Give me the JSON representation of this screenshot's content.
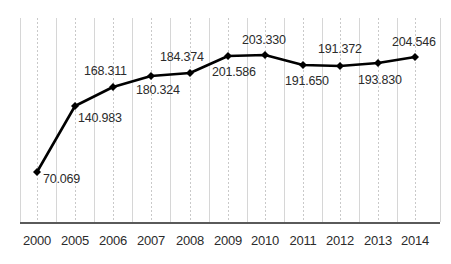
{
  "chart_data": {
    "type": "line",
    "title": "",
    "subtitle": "",
    "xlabel": "",
    "ylabel": "",
    "grid": true,
    "legend": false,
    "legend_position": "none",
    "xlim": [
      0,
      11
    ],
    "ylim": [
      0,
      230
    ],
    "categories": [
      "2000",
      "2005",
      "2006",
      "2007",
      "2008",
      "2009",
      "2010",
      "2011",
      "2012",
      "2013",
      "2014"
    ],
    "x": [
      "2000",
      "2005",
      "2006",
      "2007",
      "2008",
      "2009",
      "2010",
      "2011",
      "2012",
      "2013",
      "2014"
    ],
    "values": [
      70.069,
      140.983,
      168.311,
      180.324,
      184.374,
      201.586,
      203.33,
      191.65,
      191.372,
      193.83,
      204.546
    ],
    "series": [
      {
        "name": "",
        "color": "#000000",
        "marker": "diamond",
        "values": [
          70.069,
          140.983,
          168.311,
          180.324,
          184.374,
          201.586,
          203.33,
          191.65,
          191.372,
          193.83,
          204.546
        ]
      }
    ],
    "point_labels": [
      "70.069",
      "140.983",
      "168.311",
      "180.324",
      "184.374",
      "201.586",
      "203.330",
      "191.650",
      "191.372",
      "193.830",
      "204.546"
    ],
    "points": [
      {
        "category": "2000",
        "value": 70.069,
        "label": "70.069",
        "px": 37,
        "py": 172,
        "label_x": 43,
        "label_y": 173,
        "label_anchor": "left"
      },
      {
        "category": "2005",
        "value": 140.983,
        "label": "140.983",
        "px": 75,
        "py": 106,
        "label_x": 78,
        "label_y": 112,
        "label_anchor": "left"
      },
      {
        "category": "2006",
        "value": 168.311,
        "label": "168.311",
        "px": 113,
        "py": 87,
        "label_x": 84,
        "label_y": 65,
        "label_anchor": "left"
      },
      {
        "category": "2007",
        "value": 180.324,
        "label": "180.324",
        "px": 151,
        "py": 76,
        "label_x": 136,
        "label_y": 84,
        "label_anchor": "left"
      },
      {
        "category": "2008",
        "value": 184.374,
        "label": "184.374",
        "px": 190,
        "py": 73,
        "label_x": 160,
        "label_y": 51,
        "label_anchor": "left"
      },
      {
        "category": "2009",
        "value": 201.586,
        "label": "201.586",
        "px": 228,
        "py": 56,
        "label_x": 212,
        "label_y": 66,
        "label_anchor": "left"
      },
      {
        "category": "2010",
        "value": 203.33,
        "label": "203.330",
        "px": 265,
        "py": 55,
        "label_x": 242,
        "label_y": 34,
        "label_anchor": "left"
      },
      {
        "category": "2011",
        "value": 191.65,
        "label": "191.650",
        "px": 303,
        "py": 65,
        "label_x": 285,
        "label_y": 75,
        "label_anchor": "left"
      },
      {
        "category": "2012",
        "value": 191.372,
        "label": "191.372",
        "px": 340,
        "py": 66,
        "label_x": 318,
        "label_y": 43,
        "label_anchor": "left"
      },
      {
        "category": "2013",
        "value": 193.83,
        "label": "193.830",
        "px": 378,
        "py": 63,
        "label_x": 358,
        "label_y": 74,
        "label_anchor": "left"
      },
      {
        "category": "2014",
        "value": 204.546,
        "label": "204.546",
        "px": 415,
        "py": 57,
        "label_x": 392,
        "label_y": 36,
        "label_anchor": "left"
      }
    ],
    "axis": {
      "x_axis_y": 222,
      "x_axis_left": 20,
      "x_axis_right": 440,
      "grid_top": 18,
      "grid_bottom": 222,
      "solid_gridlines_x": [
        20,
        56,
        94,
        132,
        170,
        209,
        247,
        284,
        322,
        359,
        397,
        440
      ],
      "dotted_gridlines_x": [
        37,
        75,
        113,
        151,
        190,
        228,
        265,
        303,
        340,
        378,
        415
      ]
    },
    "colors": {
      "line": "#000000",
      "marker": "#000000",
      "grid_solid": "#d6d6d6",
      "grid_dotted": "#c9c9c9",
      "axis": "#5a5a5a",
      "text": "#2b2b2b",
      "background": "#ffffff"
    }
  }
}
